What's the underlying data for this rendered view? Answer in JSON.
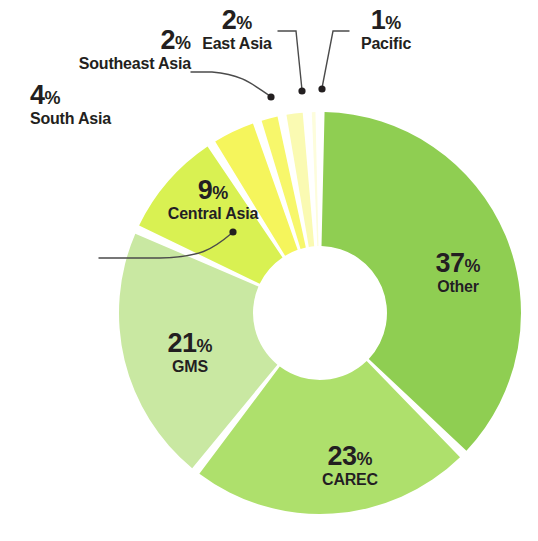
{
  "chart_data": {
    "type": "pie",
    "variant": "donut",
    "title": "",
    "subtitle": "",
    "xlabel": "",
    "ylabel": "",
    "units": "percent",
    "total": 99,
    "legend_position": "none",
    "grid": false,
    "start_angle_deg": 0,
    "direction": "clockwise",
    "categories": [
      "Other",
      "CAREC",
      "GMS",
      "Central Asia",
      "South Asia",
      "Southeast Asia",
      "East Asia",
      "Pacific"
    ],
    "values": [
      37,
      23,
      21,
      9,
      4,
      2,
      2,
      1
    ],
    "value_labels": [
      "37%",
      "23%",
      "21%",
      "9%",
      "4%",
      "2%",
      "2%",
      "1%"
    ],
    "colors": [
      "#8FCE52",
      "#AEE06C",
      "#C9E8A2",
      "#D9F152",
      "#F5F55C",
      "#F7F76B",
      "#FAFAB2",
      "#FDFDDC"
    ],
    "slices": [
      {
        "name": "Other",
        "value": 37,
        "pct_text": "37",
        "sym": "%",
        "color": "#8FCE52",
        "label_style": "inside"
      },
      {
        "name": "CAREC",
        "value": 23,
        "pct_text": "23",
        "sym": "%",
        "color": "#AEE06C",
        "label_style": "inside"
      },
      {
        "name": "GMS",
        "value": 21,
        "pct_text": "21",
        "sym": "%",
        "color": "#C9E8A2",
        "label_style": "inside"
      },
      {
        "name": "Central Asia",
        "value": 9,
        "pct_text": "9",
        "sym": "%",
        "color": "#D9F152",
        "label_style": "inside"
      },
      {
        "name": "South Asia",
        "value": 4,
        "pct_text": "4",
        "sym": "%",
        "color": "#F5F55C",
        "label_style": "callout"
      },
      {
        "name": "Southeast Asia",
        "value": 2,
        "pct_text": "2",
        "sym": "%",
        "color": "#F7F76B",
        "label_style": "callout"
      },
      {
        "name": "East Asia",
        "value": 2,
        "pct_text": "2",
        "sym": "%",
        "color": "#FAFAB2",
        "label_style": "callout"
      },
      {
        "name": "Pacific",
        "value": 1,
        "pct_text": "1",
        "sym": "%",
        "color": "#FDFDDC",
        "label_style": "callout"
      }
    ]
  },
  "labels": {
    "other": {
      "pct": "37",
      "sym": "%",
      "name": "Other"
    },
    "carec": {
      "pct": "23",
      "sym": "%",
      "name": "CAREC"
    },
    "gms": {
      "pct": "21",
      "sym": "%",
      "name": "GMS"
    },
    "central_asia": {
      "pct": "9",
      "sym": "%",
      "name": "Central Asia"
    },
    "south_asia": {
      "pct": "4",
      "sym": "%",
      "name": "South Asia"
    },
    "southeast_asia": {
      "pct": "2",
      "sym": "%",
      "name": "Southeast Asia"
    },
    "east_asia": {
      "pct": "2",
      "sym": "%",
      "name": "East Asia"
    },
    "pacific": {
      "pct": "1",
      "sym": "%",
      "name": "Pacific"
    }
  },
  "theme": {
    "background": "#FFFFFF",
    "text_color": "#231F20",
    "leader_line_color": "#4B4B4B",
    "gap_color": "#FFFFFF"
  }
}
